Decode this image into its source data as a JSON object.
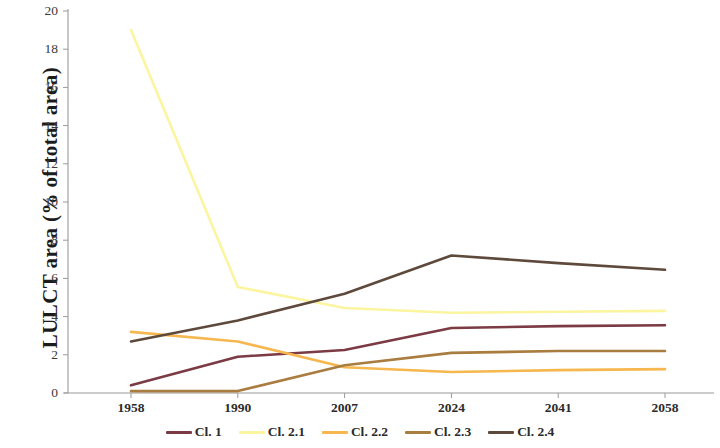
{
  "chart_data": {
    "type": "line",
    "title": "",
    "xlabel": "",
    "ylabel": "LULCT area (% of total area)",
    "categories": [
      "1958",
      "1990",
      "2007",
      "2024",
      "2041",
      "2058"
    ],
    "xlim": [
      0,
      5
    ],
    "ylim": [
      0,
      20
    ],
    "ytick_step": 2,
    "yticks": [
      "20",
      "18",
      "16",
      "14",
      "12",
      "10",
      "8",
      "6",
      "4",
      "2",
      "0"
    ],
    "grid": false,
    "legend_position": "bottom",
    "series": [
      {
        "name": "Cl. 1",
        "color": "#7b3a४4",
        "values": [
          0.4,
          1.9,
          2.25,
          3.4,
          3.5,
          3.55
        ]
      },
      {
        "name": "Cl. 2.1",
        "color": "#fbf5a0",
        "values": [
          19.0,
          5.55,
          4.45,
          4.2,
          4.25,
          4.3
        ]
      },
      {
        "name": "Cl. 2.2",
        "color": "#f5b74e",
        "values": [
          3.2,
          2.7,
          1.35,
          1.1,
          1.2,
          1.25
        ]
      },
      {
        "name": "Cl. 2.3",
        "color": "#a97c3f",
        "values": [
          0.1,
          0.1,
          1.45,
          2.1,
          2.2,
          2.2
        ]
      },
      {
        "name": "Cl. 2.4",
        "color": "#5e4a3c",
        "values": [
          2.7,
          3.8,
          5.2,
          7.2,
          6.8,
          6.45
        ]
      }
    ],
    "colors": {
      "cl1": "#7b3a44",
      "cl21": "#fbf5a0",
      "cl22": "#f5b74e",
      "cl23": "#a97c3f",
      "cl24": "#5e4a3c",
      "axis": "#9a9a9a",
      "text": "#2b2b2b"
    }
  },
  "legend": {
    "items": [
      {
        "label": "Cl. 1"
      },
      {
        "label": "Cl. 2.1"
      },
      {
        "label": "Cl. 2.2"
      },
      {
        "label": "Cl. 2.3"
      },
      {
        "label": "Cl. 2.4"
      }
    ]
  }
}
